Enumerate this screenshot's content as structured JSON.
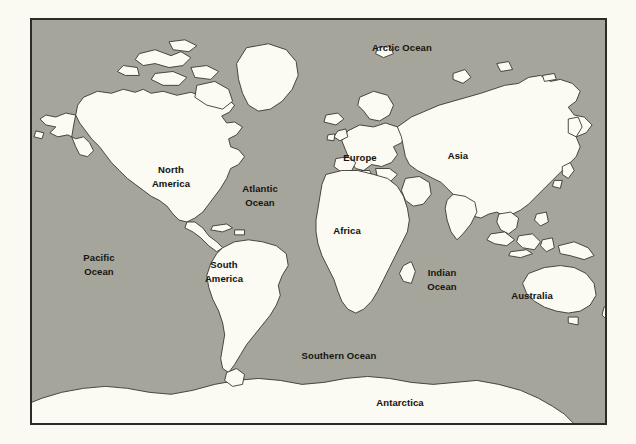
{
  "figure": {
    "name": "world-map",
    "type": "map",
    "projection": "mercator-style world map",
    "background_color": "#faf9f2",
    "ocean_color": "#a5a59c",
    "land_color": "#fbfaf3",
    "coastline_color": "#3a352e",
    "border_color": "#2e2b26",
    "label_color": "#17150f",
    "frame": {
      "x": 30,
      "y": 18,
      "width": 577,
      "height": 407
    }
  },
  "labels": [
    {
      "id": "arctic-ocean",
      "text": "Arctic Ocean",
      "kind": "ocean",
      "x": 400,
      "y": 46,
      "lines": [
        "Arctic Ocean"
      ]
    },
    {
      "id": "north-america",
      "text": "North America",
      "kind": "continent",
      "x": 169,
      "y": 175,
      "lines": [
        "North",
        "America"
      ]
    },
    {
      "id": "atlantic-ocean",
      "text": "Atlantic Ocean",
      "kind": "ocean",
      "x": 258,
      "y": 194,
      "lines": [
        "Atlantic",
        "Ocean"
      ]
    },
    {
      "id": "europe",
      "text": "Europe",
      "kind": "continent",
      "x": 358,
      "y": 155,
      "lines": [
        "Europe"
      ]
    },
    {
      "id": "asia",
      "text": "Asia",
      "kind": "continent",
      "x": 456,
      "y": 153,
      "lines": [
        "Asia"
      ]
    },
    {
      "id": "africa",
      "text": "Africa",
      "kind": "continent",
      "x": 345,
      "y": 228,
      "lines": [
        "Africa"
      ]
    },
    {
      "id": "pacific-ocean",
      "text": "Pacific Ocean",
      "kind": "ocean",
      "x": 97,
      "y": 263,
      "lines": [
        "Pacific",
        "Ocean"
      ]
    },
    {
      "id": "south-america",
      "text": "South America",
      "kind": "continent",
      "x": 222,
      "y": 270,
      "lines": [
        "South",
        "America"
      ]
    },
    {
      "id": "indian-ocean",
      "text": "Indian Ocean",
      "kind": "ocean",
      "x": 440,
      "y": 278,
      "lines": [
        "Indian",
        "Ocean"
      ]
    },
    {
      "id": "australia",
      "text": "Australia",
      "kind": "continent",
      "x": 530,
      "y": 293,
      "lines": [
        "Australia"
      ]
    },
    {
      "id": "southern-ocean",
      "text": "Southern Ocean",
      "kind": "ocean",
      "x": 337,
      "y": 353,
      "lines": [
        "Southern Ocean"
      ]
    },
    {
      "id": "antarctica",
      "text": "Antarctica",
      "kind": "continent",
      "x": 398,
      "y": 400,
      "lines": [
        "Antarctica"
      ]
    }
  ]
}
